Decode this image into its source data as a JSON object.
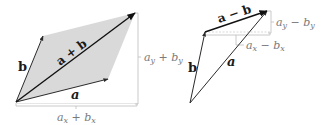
{
  "diagram": {
    "left": {
      "name": "vector-sum-parallelogram",
      "vectors": {
        "a": {
          "label": "a",
          "from": [
            16,
            102
          ],
          "to": [
            108,
            79
          ]
        },
        "b": {
          "label": "b",
          "from": [
            16,
            102
          ],
          "to": [
            43,
            36
          ]
        },
        "sum": {
          "label": "a + b",
          "from": [
            16,
            102
          ],
          "to": [
            135,
            13
          ]
        }
      },
      "components": {
        "horizontal": {
          "label_base": "a",
          "label_sub1": "x",
          "op": " + ",
          "label_base2": "b",
          "label_sub2": "x"
        },
        "vertical": {
          "label_base": "a",
          "label_sub1": "y",
          "op": " + ",
          "label_base2": "b",
          "label_sub2": "y"
        }
      },
      "fill_color": "#d9d9d9"
    },
    "right": {
      "name": "vector-difference-triangle",
      "vectors": {
        "a": {
          "label": "a",
          "from": [
            190,
            103
          ],
          "to": [
            267,
            11
          ]
        },
        "b": {
          "label": "b",
          "from": [
            190,
            103
          ],
          "to": [
            205,
            32
          ]
        },
        "diff": {
          "label": "a − b",
          "from": [
            205,
            32
          ],
          "to": [
            267,
            11
          ]
        }
      },
      "components": {
        "horizontal": {
          "label_base": "a",
          "label_sub1": "x",
          "op": " − ",
          "label_base2": "b",
          "label_sub2": "x"
        },
        "vertical": {
          "label_base": "a",
          "label_sub1": "y",
          "op": " − ",
          "label_base2": "b",
          "label_sub2": "y"
        }
      }
    },
    "colors": {
      "vector": "#2a2a2a",
      "sum_vector": "#1a1a1a",
      "guide": "#bdbdbd",
      "label": "#1a1a1a",
      "component_label": "#7a7a7a"
    }
  }
}
